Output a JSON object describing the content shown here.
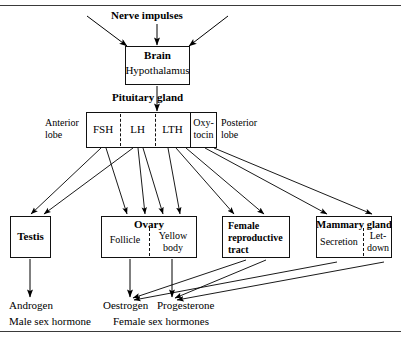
{
  "diagram": {
    "title_hidden": "",
    "top_label": "Nerve impulses",
    "brain": {
      "line1": "Brain",
      "line2": "Hypothalamus"
    },
    "pituitary_label": "Pituitary gland",
    "pituitary": {
      "anterior_lobe": "Anterior\nlobe",
      "anterior_lobe_line1": "Anterior",
      "anterior_lobe_line2": "lobe",
      "posterior_lobe_line1": "Posterior",
      "posterior_lobe_line2": "lobe",
      "cells": [
        {
          "label": "FSH"
        },
        {
          "label": "LH"
        },
        {
          "label": "LTH"
        },
        {
          "label_line1": "Oxy-",
          "label_line2": "tocin"
        }
      ]
    },
    "targets": [
      {
        "name": "testis",
        "title": "Testis",
        "sub": []
      },
      {
        "name": "ovary",
        "title": "Ovary",
        "sub": [
          "Follicle",
          "Yellow body"
        ],
        "sub_right_line1": "Yellow",
        "sub_right_line2": "body"
      },
      {
        "name": "female-reproductive-tract",
        "title_line1": "Female",
        "title_line2": "reproductive",
        "title_line3": "tract",
        "sub": []
      },
      {
        "name": "mammary-gland",
        "title": "Mammary gland",
        "sub": [
          "Secretion",
          "Let-down"
        ],
        "sub_right_line1": "Let-",
        "sub_right_line2": "down"
      }
    ],
    "hormones": [
      {
        "name": "androgen",
        "label": "Androgen"
      },
      {
        "name": "oestrogen",
        "label": "Oestrogen"
      },
      {
        "name": "progesterone",
        "label": "Progesterone"
      }
    ],
    "captions": [
      {
        "name": "male-sex-hormone",
        "label": "Male sex hormone"
      },
      {
        "name": "female-sex-hormones",
        "label": "Female sex hormones"
      }
    ],
    "colors": {
      "ink": "#000000",
      "rule": "#3a3a3a",
      "background": "#ffffff"
    }
  }
}
